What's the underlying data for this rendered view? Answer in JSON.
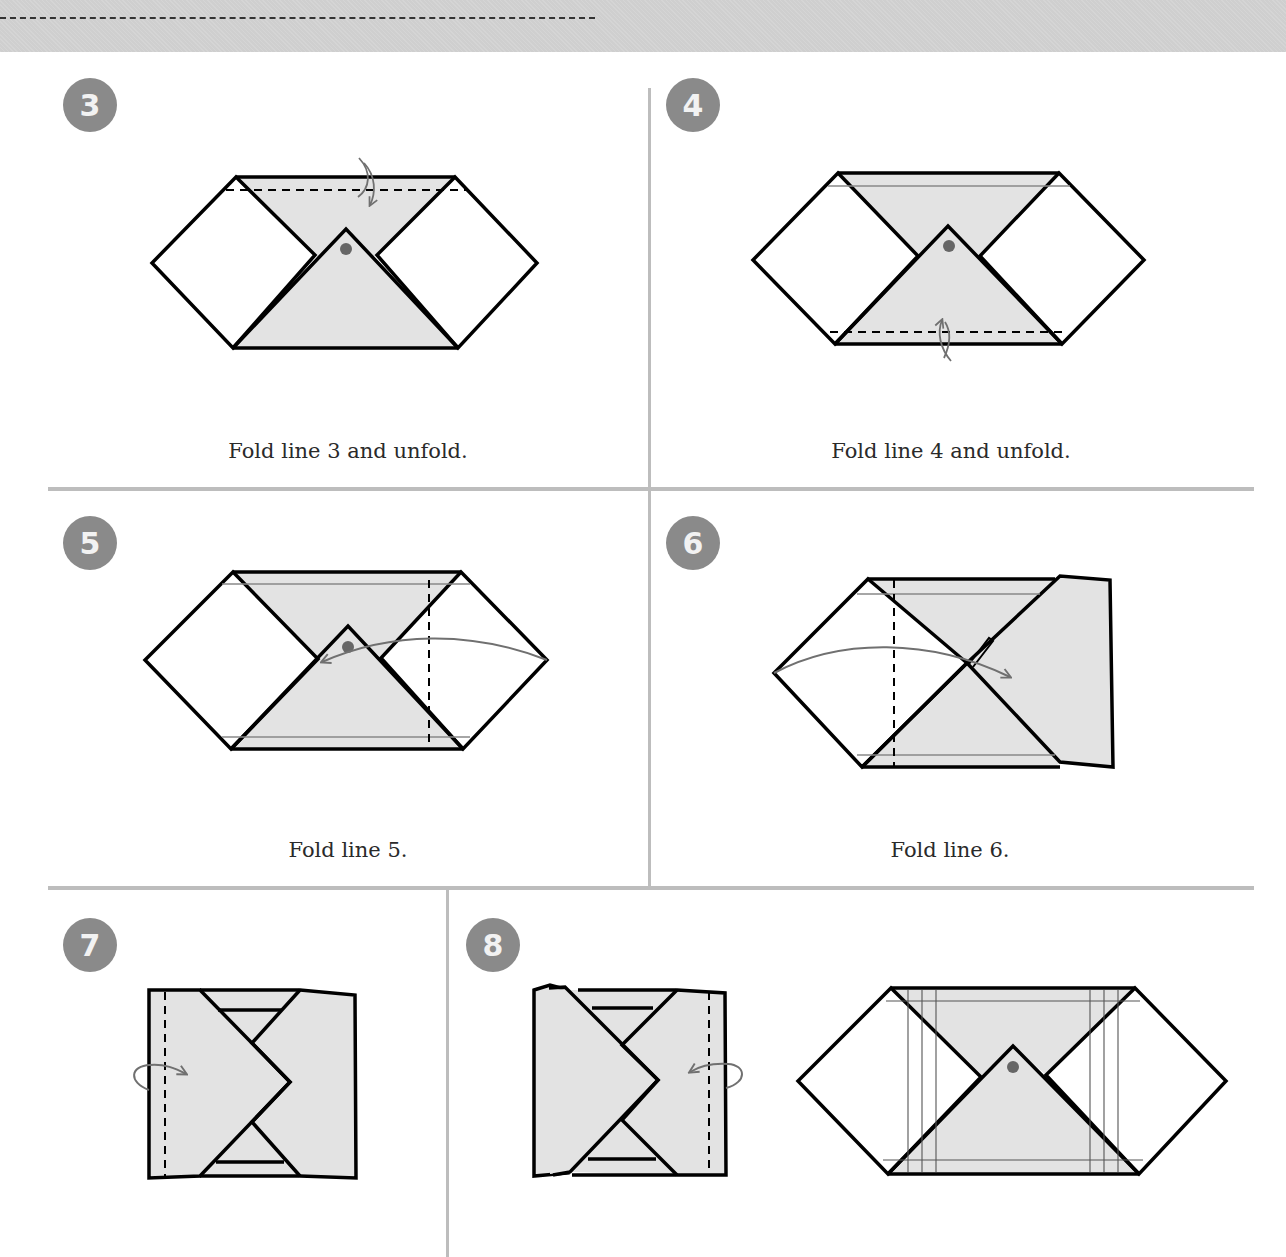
{
  "header": {
    "band_color": "#cfcfcf",
    "dashed_line": "cut-line"
  },
  "colors": {
    "paper_shaded": "#e3e3e3",
    "paper_white": "#ffffff",
    "outline": "#000000",
    "arrow": "#707070",
    "dot": "#666666",
    "badge": "#8a8a8a",
    "divider": "#bdbdbd"
  },
  "steps": [
    {
      "number": "3",
      "caption": "Fold line 3 and unfold.",
      "icon": "valley-fold-unfold-arrow"
    },
    {
      "number": "4",
      "caption": "Fold line 4 and unfold.",
      "icon": "valley-fold-unfold-arrow"
    },
    {
      "number": "5",
      "caption": "Fold line 5.",
      "icon": "fold-over-arrow"
    },
    {
      "number": "6",
      "caption": "Fold line 6.",
      "icon": "fold-over-arrow"
    },
    {
      "number": "7",
      "caption": "",
      "icon": "fold-behind-arrow"
    },
    {
      "number": "8",
      "caption": "",
      "icon": "fold-behind-arrow"
    }
  ]
}
